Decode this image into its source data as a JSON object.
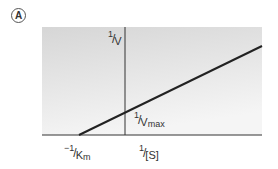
{
  "panel_label": "A",
  "diagram": {
    "type": "Lineweaver-Burk plot",
    "y_axis_label": {
      "numerator": "1",
      "denominator": "V"
    },
    "x_axis_label": {
      "numerator": "1",
      "denominator": "[S]"
    },
    "y_intercept_label": {
      "numerator": "1",
      "denominator": "V",
      "subscript": "max"
    },
    "x_intercept_label": {
      "sign": "−",
      "numerator": "1",
      "denominator": "K",
      "subscript": "m"
    },
    "colors": {
      "background_top": "#d9d9d9",
      "background_bottom": "#f4f4f4",
      "line": "#222222",
      "axis": "#333333"
    }
  }
}
